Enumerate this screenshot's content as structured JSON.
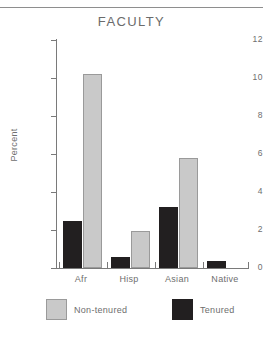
{
  "chart_data": {
    "type": "bar",
    "title": "FACULTY",
    "xlabel": "",
    "ylabel": "Percent",
    "categories": [
      "Afr",
      "Hisp",
      "Asian",
      "Native"
    ],
    "series": [
      {
        "name": "Tenured",
        "color": "#221f20",
        "values": [
          2.5,
          0.6,
          3.2,
          0.35
        ]
      },
      {
        "name": "Non-tenured",
        "color": "#c9c9c9",
        "values": [
          10.2,
          1.95,
          5.8,
          0
        ]
      }
    ],
    "ylim": [
      0,
      12
    ],
    "yticks": [
      0,
      2,
      4,
      6,
      8,
      10,
      12
    ],
    "ytick_labels": [
      "0",
      "2",
      "4",
      "6",
      "8",
      "10",
      "12"
    ],
    "grid": false,
    "legend_position": "bottom",
    "legend_order": [
      "Non-tenured",
      "Tenured"
    ]
  },
  "legend": {
    "nontenured_label": "Non-tenured",
    "tenured_label": "Tenured"
  },
  "colors": {
    "tenured": "#221f20",
    "nontenured": "#c9c9c9",
    "axis": "#7a7a7a",
    "text": "#6e6e6e"
  }
}
